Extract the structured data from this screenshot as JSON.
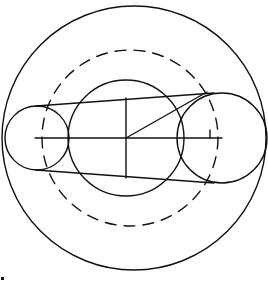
{
  "diagram": {
    "type": "geometric-construction",
    "colors": {
      "stroke": "#111111",
      "background": "#ffffff"
    },
    "circles": [
      {
        "id": "outer-circle",
        "cx": 134,
        "cy": 138,
        "r": 132,
        "style": "solid"
      },
      {
        "id": "dashed-circle",
        "cx": 130,
        "cy": 138,
        "r": 88,
        "style": "dashed"
      },
      {
        "id": "middle-circle",
        "cx": 126,
        "cy": 138,
        "r": 58,
        "style": "solid"
      },
      {
        "id": "left-pulley",
        "cx": 37,
        "cy": 138,
        "r": 32,
        "style": "solid"
      },
      {
        "id": "right-pulley",
        "cx": 222,
        "cy": 138,
        "r": 45,
        "style": "solid"
      }
    ],
    "lines": [
      {
        "id": "center-axis",
        "x1": 35,
        "y1": 138,
        "x2": 222,
        "y2": 138
      },
      {
        "id": "vertical-chord",
        "x1": 126,
        "y1": 98,
        "x2": 126,
        "y2": 178
      },
      {
        "id": "radius-diagonal",
        "x1": 126,
        "y1": 138,
        "x2": 207,
        "y2": 92
      },
      {
        "id": "belt-top",
        "x1": 36,
        "y1": 106,
        "x2": 214,
        "y2": 93
      },
      {
        "id": "belt-bottom",
        "x1": 36,
        "y1": 170,
        "x2": 214,
        "y2": 183
      },
      {
        "id": "right-tick",
        "x1": 210,
        "y1": 130,
        "x2": 210,
        "y2": 138
      }
    ]
  }
}
